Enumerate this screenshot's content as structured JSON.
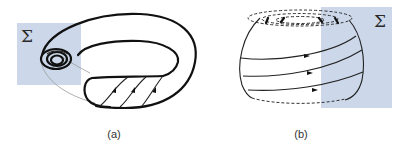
{
  "figure": {
    "panels": [
      {
        "id": "a",
        "caption": "(a)",
        "surface": "torus",
        "section_label": "Σ",
        "section_color": "#ccd8ea",
        "flow_arrow_count": 3,
        "spiral_turns": 3
      },
      {
        "id": "b",
        "caption": "(b)",
        "surface": "sphere-like solid with dashed top rings",
        "section_label": "Σ",
        "section_color": "#ccd8ea",
        "flow_arrow_count": 3,
        "dashed_ring_count": 3
      }
    ]
  }
}
